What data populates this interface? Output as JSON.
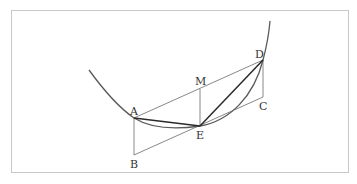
{
  "figure": {
    "type": "geometry-diagram",
    "points": {
      "A": {
        "label": "A",
        "x": 134,
        "y": 118
      },
      "B": {
        "label": "B",
        "x": 134,
        "y": 155
      },
      "C": {
        "label": "C",
        "x": 263,
        "y": 97
      },
      "D": {
        "label": "D",
        "x": 263,
        "y": 60
      },
      "E": {
        "label": "E",
        "x": 200,
        "y": 126
      },
      "M": {
        "label": "M",
        "x": 200,
        "y": 89
      }
    },
    "labels": {
      "A": "A",
      "B": "B",
      "C": "C",
      "D": "D",
      "E": "E",
      "M": "M"
    },
    "segments_thin": [
      "A-D",
      "A-B",
      "B-C",
      "C-D",
      "M-E"
    ],
    "segments_thick": [
      "A-E",
      "E-D"
    ],
    "curve": "convex curve through A, E, D"
  },
  "colors": {
    "frame": "#c8c8c8",
    "thin_line": "#6a6a6a",
    "thick_line": "#2a2a2a",
    "curve": "#5a5a5a",
    "label": "#333333"
  }
}
